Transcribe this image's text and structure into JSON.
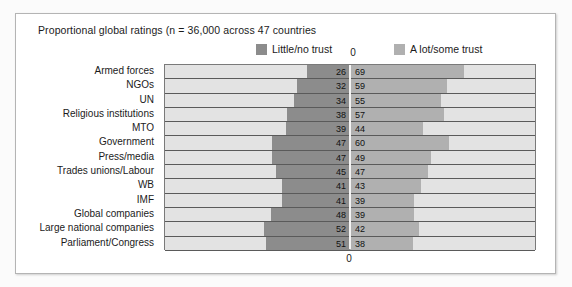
{
  "figure": {
    "title": "Proportional global ratings (n = 36,000 across 47 countries",
    "axis_zero_top": "0",
    "axis_zero_bottom": "0"
  },
  "legend": {
    "left": {
      "label": "Little/no trust",
      "color": "#8c8c8c",
      "swatch_name": "legend-swatch-little-no-trust"
    },
    "right": {
      "label": "A lot/some trust",
      "color": "#b0b0b0",
      "swatch_name": "legend-swatch-a-lot-some-trust"
    }
  },
  "chart_data": {
    "type": "bar",
    "subtype": "diverging-horizontal-tornado",
    "title": "Proportional global ratings (n = 36,000 across 47 countries",
    "xlabel": "",
    "ylabel": "",
    "xlim": [
      -100,
      100
    ],
    "axis_center_value": 0,
    "grid": false,
    "legend_position": "top",
    "value_unit": "percent",
    "categories": [
      "Armed forces",
      "NGOs",
      "UN",
      "Religious institutions",
      "MTO",
      "Government",
      "Press/media",
      "Trades unions/Labour",
      "WB",
      "IMF",
      "Global companies",
      "Large national companies",
      "Parliament/Congress"
    ],
    "series": [
      {
        "name": "Little/no trust",
        "direction": "left",
        "color": "#8c8c8c",
        "values": [
          26,
          32,
          34,
          38,
          39,
          47,
          47,
          45,
          41,
          41,
          48,
          52,
          51
        ]
      },
      {
        "name": "A lot/some trust",
        "direction": "right",
        "color": "#b0b0b0",
        "values": [
          69,
          59,
          55,
          57,
          44,
          60,
          49,
          47,
          43,
          39,
          39,
          42,
          38
        ]
      }
    ],
    "rows": [
      {
        "category": "Armed forces",
        "little_no_trust": 26,
        "a_lot_some_trust": 69
      },
      {
        "category": "NGOs",
        "little_no_trust": 32,
        "a_lot_some_trust": 59
      },
      {
        "category": "UN",
        "little_no_trust": 34,
        "a_lot_some_trust": 55
      },
      {
        "category": "Religious institutions",
        "little_no_trust": 38,
        "a_lot_some_trust": 57
      },
      {
        "category": "MTO",
        "little_no_trust": 39,
        "a_lot_some_trust": 44
      },
      {
        "category": "Government",
        "little_no_trust": 47,
        "a_lot_some_trust": 60
      },
      {
        "category": "Press/media",
        "little_no_trust": 47,
        "a_lot_some_trust": 49
      },
      {
        "category": "Trades unions/Labour",
        "little_no_trust": 45,
        "a_lot_some_trust": 47
      },
      {
        "category": "WB",
        "little_no_trust": 41,
        "a_lot_some_trust": 43
      },
      {
        "category": "IMF",
        "little_no_trust": 41,
        "a_lot_some_trust": 39
      },
      {
        "category": "Global companies",
        "little_no_trust": 48,
        "a_lot_some_trust": 39
      },
      {
        "category": "Large national companies",
        "little_no_trust": 52,
        "a_lot_some_trust": 42
      },
      {
        "category": "Parliament/Congress",
        "little_no_trust": 51,
        "a_lot_some_trust": 38
      }
    ]
  },
  "colors": {
    "negative_bar": "#8c8c8c",
    "positive_bar": "#b0b0b0",
    "track": "#e3e3e3",
    "plot_border": "#7a7a7a",
    "card_border": "#b4b4b4",
    "text": "#1b1b1b"
  }
}
